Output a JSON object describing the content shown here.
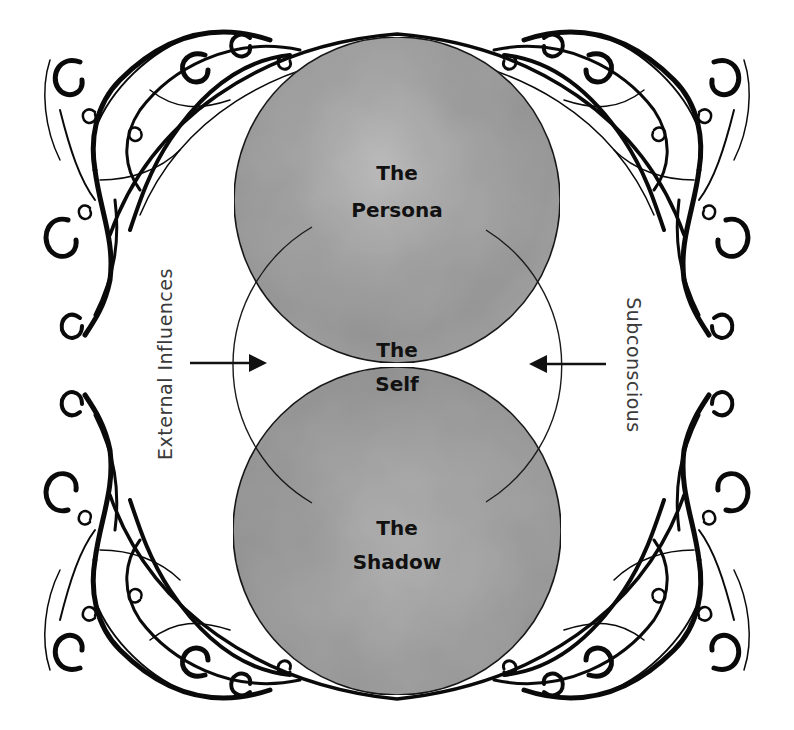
{
  "diagram": {
    "type": "psyche-model",
    "colors": {
      "circle_fill": "#a9a9a9",
      "circle_fill_light": "#bdbdbd",
      "circle_fill_dark": "#969696",
      "stroke": "#1a1a1a",
      "ornament": "#0a0a0a",
      "background": "#ffffff"
    },
    "nodes": [
      {
        "id": "persona",
        "line1": "The",
        "line2": "Persona",
        "shape": "shaded-circle",
        "position": "top"
      },
      {
        "id": "self",
        "line1": "The",
        "line2": "Self",
        "shape": "outline-circle",
        "position": "center"
      },
      {
        "id": "shadow",
        "line1": "The",
        "line2": "Shadow",
        "shape": "shaded-circle",
        "position": "bottom"
      }
    ],
    "side_labels": {
      "left": "External Influences",
      "right": "Subconscious"
    },
    "arrows": [
      {
        "from": "left",
        "to": "self",
        "direction": "right-pointing"
      },
      {
        "from": "right",
        "to": "self",
        "direction": "left-pointing"
      }
    ],
    "decoration": "ornate-swirl-corner-frame"
  }
}
